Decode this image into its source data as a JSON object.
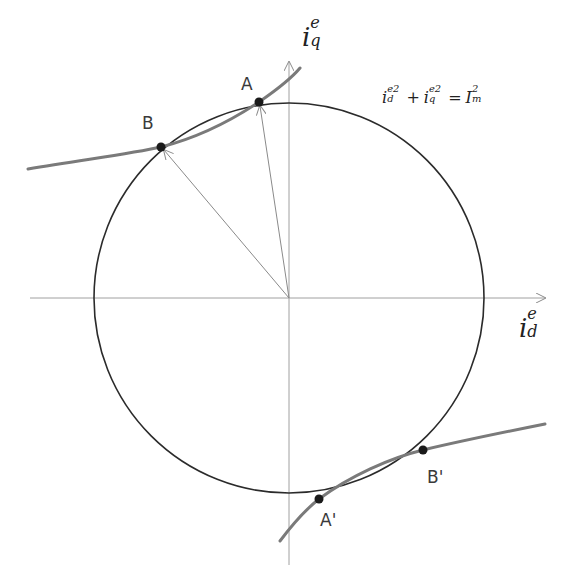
{
  "diagram": {
    "axes": {
      "d_axis": {
        "label_base": "i",
        "label_sup": "e",
        "label_sub": "d"
      },
      "q_axis": {
        "label_base": "i",
        "label_sup": "e",
        "label_sub": "q"
      }
    },
    "equation": {
      "lhs1_base": "i",
      "lhs1_sup": "e2",
      "lhs1_sub": "d",
      "plus": "+",
      "lhs2_base": "i",
      "lhs2_sup": "e2",
      "lhs2_sub": "q",
      "equals": "=",
      "rhs_base": "I",
      "rhs_sup": "2",
      "rhs_sub": "m"
    },
    "points": [
      {
        "id": "A",
        "label": "A"
      },
      {
        "id": "B",
        "label": "B"
      },
      {
        "id": "A_prime",
        "label": "A'"
      },
      {
        "id": "B_prime",
        "label": "B'"
      }
    ],
    "colors": {
      "circle": "#2b2b2b",
      "torque_curve": "#7a7a7a",
      "axis": "#9a9a9a",
      "vector": "#8a8a8a",
      "point": "#1a1a1a"
    }
  }
}
